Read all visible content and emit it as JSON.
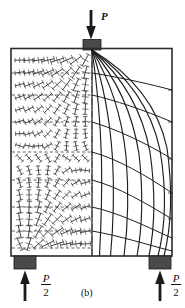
{
  "figure": {
    "caption": "(b)",
    "top_load_label": "P",
    "reaction_numerator": "P",
    "reaction_denominator": "2",
    "geometry": {
      "panel_left": 11,
      "panel_top": 48,
      "panel_right": 172,
      "panel_bottom": 256,
      "centerline_x": 92,
      "load_plate": {
        "x": 83,
        "y": 40,
        "w": 18,
        "h": 10
      },
      "support_left_plate": {
        "x": 14,
        "y": 256,
        "w": 22,
        "h": 13
      },
      "support_right_plate": {
        "x": 149,
        "y": 256,
        "w": 22,
        "h": 13
      }
    },
    "colors": {
      "ink": "#1a1a1a",
      "plate_fill": "#4a4a4a",
      "frame": "#2b2b2b",
      "background": "#ffffff"
    }
  },
  "chart_data": {
    "type": "line",
    "xlabel": "",
    "ylabel": "",
    "xlim": [
      0,
      1
    ],
    "ylim": [
      0,
      1
    ],
    "grid": false,
    "legend": null,
    "annotations": [
      {
        "text": "P",
        "role": "applied-load",
        "x": 0.5,
        "y": 1.0
      },
      {
        "text": "P/2",
        "role": "reaction-left",
        "x": 0.08,
        "y": 0.0
      },
      {
        "text": "P/2",
        "role": "reaction-right",
        "x": 0.92,
        "y": 0.0
      },
      {
        "text": "(b)",
        "role": "figure-caption",
        "x": 0.5,
        "y": -0.12
      }
    ],
    "series": [
      {
        "name": "compression-trajectory-1",
        "kind": "solid-curve",
        "x": [
          0.5,
          0.5,
          0.5,
          0.5,
          0.5,
          0.5
        ],
        "y": [
          1.0,
          0.8,
          0.6,
          0.4,
          0.2,
          0.0
        ]
      },
      {
        "name": "compression-trajectory-2",
        "kind": "solid-curve",
        "x": [
          0.5,
          0.545,
          0.575,
          0.59,
          0.59,
          0.575
        ],
        "y": [
          1.0,
          0.8,
          0.6,
          0.4,
          0.2,
          0.0
        ]
      },
      {
        "name": "compression-trajectory-3",
        "kind": "solid-curve",
        "x": [
          0.5,
          0.6,
          0.66,
          0.69,
          0.69,
          0.66
        ],
        "y": [
          1.0,
          0.8,
          0.6,
          0.4,
          0.2,
          0.0
        ]
      },
      {
        "name": "compression-trajectory-4",
        "kind": "solid-curve",
        "x": [
          0.5,
          0.655,
          0.74,
          0.79,
          0.795,
          0.75
        ],
        "y": [
          1.0,
          0.8,
          0.6,
          0.4,
          0.2,
          0.0
        ]
      },
      {
        "name": "compression-trajectory-5",
        "kind": "solid-curve",
        "x": [
          0.5,
          0.71,
          0.815,
          0.875,
          0.88,
          0.83
        ],
        "y": [
          1.0,
          0.8,
          0.6,
          0.4,
          0.2,
          0.0
        ]
      },
      {
        "name": "compression-trajectory-6",
        "kind": "solid-curve",
        "x": [
          0.5,
          0.76,
          0.88,
          0.945,
          0.95,
          0.895
        ],
        "y": [
          1.0,
          0.8,
          0.6,
          0.4,
          0.2,
          0.0
        ]
      },
      {
        "name": "compression-trajectory-7",
        "kind": "solid-curve",
        "x": [
          0.5,
          0.8,
          0.93,
          0.985,
          0.99,
          0.945
        ],
        "y": [
          1.0,
          0.8,
          0.6,
          0.4,
          0.2,
          0.0
        ]
      },
      {
        "name": "tension-trajectory-1",
        "kind": "solid-orthogonal",
        "x": [
          0.5,
          0.7,
          0.9,
          1.0
        ],
        "y": [
          0.88,
          0.9,
          0.93,
          0.96
        ]
      },
      {
        "name": "tension-trajectory-2",
        "kind": "solid-orthogonal",
        "x": [
          0.5,
          0.7,
          0.9,
          1.0
        ],
        "y": [
          0.74,
          0.78,
          0.84,
          0.88
        ]
      },
      {
        "name": "tension-trajectory-3",
        "kind": "solid-orthogonal",
        "x": [
          0.5,
          0.7,
          0.9,
          1.0
        ],
        "y": [
          0.58,
          0.64,
          0.73,
          0.79
        ]
      },
      {
        "name": "tension-trajectory-4",
        "kind": "solid-orthogonal",
        "x": [
          0.5,
          0.7,
          0.9,
          1.0
        ],
        "y": [
          0.42,
          0.49,
          0.6,
          0.68
        ]
      },
      {
        "name": "tension-trajectory-5",
        "kind": "solid-orthogonal",
        "x": [
          0.5,
          0.7,
          0.9,
          1.0
        ],
        "y": [
          0.28,
          0.34,
          0.45,
          0.55
        ]
      },
      {
        "name": "tension-trajectory-6",
        "kind": "solid-orthogonal",
        "x": [
          0.5,
          0.7,
          0.9,
          1.0
        ],
        "y": [
          0.16,
          0.21,
          0.3,
          0.4
        ]
      },
      {
        "name": "tension-trajectory-7",
        "kind": "solid-orthogonal",
        "x": [
          0.5,
          0.7,
          0.9,
          1.0
        ],
        "y": [
          0.07,
          0.1,
          0.16,
          0.24
        ]
      },
      {
        "name": "isostatic-dashed-1",
        "kind": "dashed-horizontal",
        "x": [
          0.0,
          0.5
        ],
        "y": [
          0.88,
          0.88
        ]
      },
      {
        "name": "isostatic-dashed-2",
        "kind": "dashed-horizontal",
        "x": [
          0.0,
          0.5
        ],
        "y": [
          0.74,
          0.74
        ]
      },
      {
        "name": "isostatic-dashed-3",
        "kind": "dashed-horizontal",
        "x": [
          0.0,
          0.5
        ],
        "y": [
          0.58,
          0.58
        ]
      },
      {
        "name": "isostatic-dashed-4",
        "kind": "dashed-horizontal",
        "x": [
          0.0,
          0.5
        ],
        "y": [
          0.42,
          0.42
        ]
      },
      {
        "name": "isostatic-dashed-5",
        "kind": "dashed-horizontal",
        "x": [
          0.0,
          0.5
        ],
        "y": [
          0.28,
          0.28
        ]
      },
      {
        "name": "isostatic-dashed-6",
        "kind": "dashed-horizontal",
        "x": [
          0.0,
          0.5
        ],
        "y": [
          0.16,
          0.16
        ]
      },
      {
        "name": "isostatic-dashed-7",
        "kind": "dashed-horizontal",
        "x": [
          0.0,
          0.5
        ],
        "y": [
          0.07,
          0.07
        ]
      }
    ],
    "vector_field": {
      "name": "principal-stress-direction-crosses",
      "region": "left-half",
      "cols": 8,
      "rows": 16,
      "description": "Grid of small cross/tick glyphs whose orientation follows the principal stress directions; glyph size grows toward the loaded corner and the left support."
    }
  }
}
